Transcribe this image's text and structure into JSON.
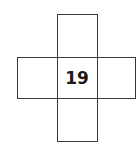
{
  "diagram": {
    "type": "cross-shaped grid of five squares",
    "cells": {
      "top": "",
      "left": "",
      "center": "19",
      "right": "",
      "bottom": ""
    }
  }
}
